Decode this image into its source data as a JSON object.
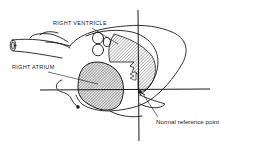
{
  "diagram": {
    "type": "anatomical line drawing (heart, lateral view with reference axes)",
    "labels": {
      "right_ventricle": "RIGHT VENTRICLE",
      "right_atrium": "RIGHT ATRIUM",
      "reference_point": "Normal reference point"
    },
    "colors": {
      "line": "#1a1a1a",
      "background": "#ffffff",
      "hatch": "#555555"
    }
  }
}
